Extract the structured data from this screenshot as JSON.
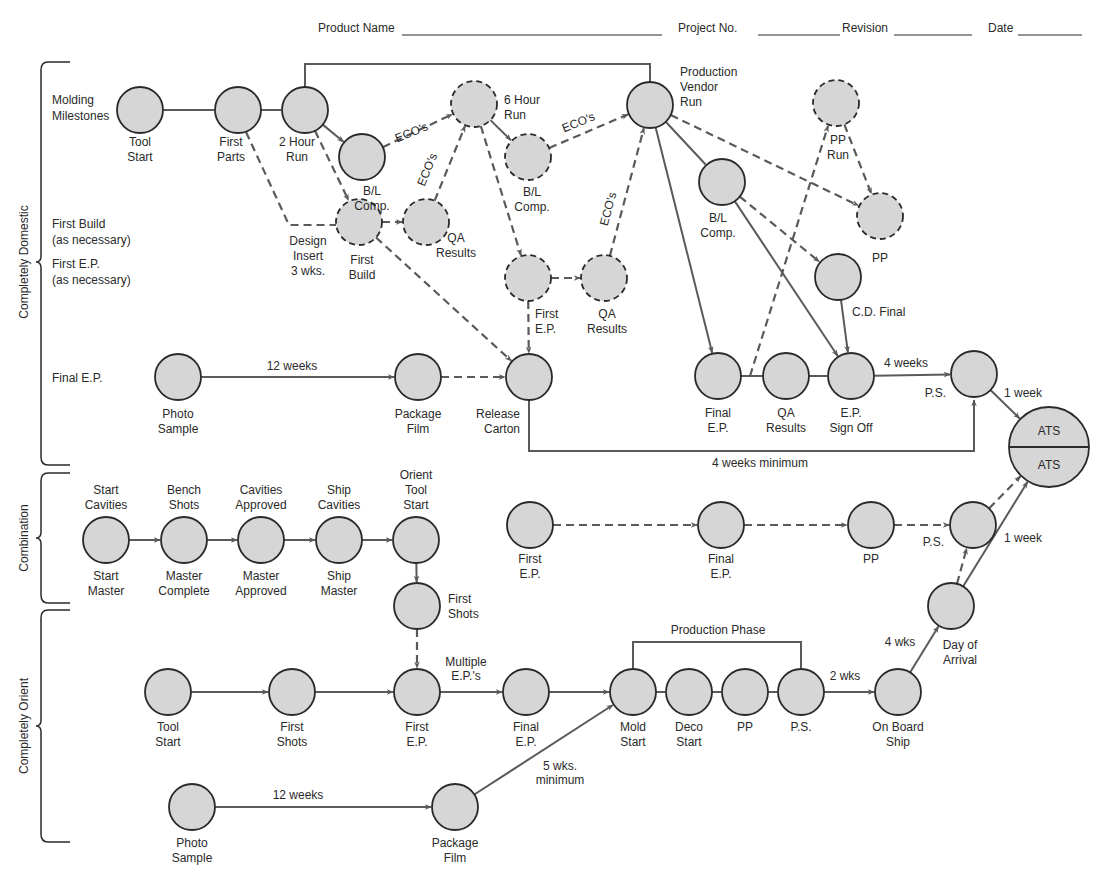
{
  "header": {
    "fields": [
      {
        "label": "Product Name",
        "x": 318,
        "line_x1": 402,
        "line_x2": 662
      },
      {
        "label": "Project No.",
        "x": 678,
        "line_x1": 758,
        "line_x2": 840
      },
      {
        "label": "Revision",
        "x": 842,
        "line_x1": 894,
        "line_x2": 972
      },
      {
        "label": "Date",
        "x": 988,
        "line_x1": 1018,
        "line_x2": 1082
      }
    ]
  },
  "groups": [
    {
      "label": "Completely Domestic",
      "y_top": 62,
      "y_bottom": 465,
      "label_y": 262
    },
    {
      "label": "Combination",
      "y_top": 473,
      "y_bottom": 603,
      "label_y": 538
    },
    {
      "label": "Completely Orient",
      "y_top": 610,
      "y_bottom": 842,
      "label_y": 726
    }
  ],
  "row_labels": [
    {
      "lines": [
        "Molding",
        "Milestones"
      ],
      "x": 52,
      "y": 104
    },
    {
      "lines": [
        "First Build",
        "(as necessary)"
      ],
      "x": 52,
      "y": 228
    },
    {
      "lines": [
        "First E.P.",
        "(as necessary)"
      ],
      "x": 52,
      "y": 268
    },
    {
      "lines": [
        "Final E.P."
      ],
      "x": 52,
      "y": 382
    }
  ],
  "nodes": [
    {
      "id": "d_tool_start",
      "x": 140,
      "y": 110,
      "r": 23,
      "dashed": false,
      "label": [
        "Tool",
        "Start"
      ],
      "lx": 140,
      "ly": 146,
      "anchor": "middle"
    },
    {
      "id": "d_first_parts",
      "x": 238,
      "y": 110,
      "r": 23,
      "dashed": false,
      "label": [
        "First",
        "Parts"
      ],
      "lx": 231,
      "ly": 146,
      "anchor": "middle"
    },
    {
      "id": "d_2hr_run",
      "x": 305,
      "y": 110,
      "r": 23,
      "dashed": false,
      "label": [
        "2 Hour",
        "Run"
      ],
      "lx": 297,
      "ly": 146,
      "anchor": "middle"
    },
    {
      "id": "d_bl_comp_1",
      "x": 362,
      "y": 157,
      "r": 23,
      "dashed": false,
      "label": [
        "B/L",
        "Comp."
      ],
      "lx": 372,
      "ly": 195,
      "anchor": "middle"
    },
    {
      "id": "d_6hr_run",
      "x": 474,
      "y": 104,
      "r": 23,
      "dashed": true,
      "label": [
        "6 Hour",
        "Run"
      ],
      "lx": 504,
      "ly": 104,
      "anchor": "start"
    },
    {
      "id": "d_bl_comp_2",
      "x": 528,
      "y": 157,
      "r": 23,
      "dashed": true,
      "label": [
        "B/L",
        "Comp."
      ],
      "lx": 532,
      "ly": 196,
      "anchor": "middle"
    },
    {
      "id": "d_first_build",
      "x": 359,
      "y": 222,
      "r": 23,
      "dashed": true,
      "label": [
        "First",
        "Build"
      ],
      "lx": 362,
      "ly": 264,
      "anchor": "middle"
    },
    {
      "id": "d_qa_results_1",
      "x": 426,
      "y": 222,
      "r": 23,
      "dashed": true,
      "label": [
        "QA",
        "Results"
      ],
      "lx": 456,
      "ly": 242,
      "anchor": "middle"
    },
    {
      "id": "d_first_ep",
      "x": 528,
      "y": 278,
      "r": 23,
      "dashed": true,
      "label": [
        "First",
        "E.P."
      ],
      "lx": 535,
      "ly": 318,
      "anchor": "start"
    },
    {
      "id": "d_qa_results_2",
      "x": 604,
      "y": 278,
      "r": 23,
      "dashed": true,
      "label": [
        "QA",
        "Results"
      ],
      "lx": 607,
      "ly": 318,
      "anchor": "middle"
    },
    {
      "id": "d_prod_vendor_run",
      "x": 650,
      "y": 105,
      "r": 23,
      "dashed": false,
      "label": [
        "Production",
        "Vendor",
        "Run"
      ],
      "lx": 680,
      "ly": 76,
      "anchor": "start"
    },
    {
      "id": "d_bl_comp_3",
      "x": 722,
      "y": 182,
      "r": 23,
      "dashed": false,
      "label": [
        "B/L",
        "Comp."
      ],
      "lx": 718,
      "ly": 222,
      "anchor": "middle"
    },
    {
      "id": "d_pp_run",
      "x": 836,
      "y": 103,
      "r": 23,
      "dashed": true,
      "label": [
        "PP",
        "Run"
      ],
      "lx": 838,
      "ly": 144,
      "anchor": "middle"
    },
    {
      "id": "d_pp",
      "x": 880,
      "y": 216,
      "r": 23,
      "dashed": true,
      "label": [
        "PP"
      ],
      "lx": 880,
      "ly": 262,
      "anchor": "middle"
    },
    {
      "id": "d_cd_final",
      "x": 838,
      "y": 277,
      "r": 23,
      "dashed": false,
      "label": [
        "C.D. Final"
      ],
      "lx": 852,
      "ly": 316,
      "anchor": "start"
    },
    {
      "id": "d_photo_sample",
      "x": 178,
      "y": 377,
      "r": 23,
      "dashed": false,
      "label": [
        "Photo",
        "Sample"
      ],
      "lx": 178,
      "ly": 418,
      "anchor": "middle"
    },
    {
      "id": "d_package_film",
      "x": 418,
      "y": 377,
      "r": 23,
      "dashed": false,
      "label": [
        "Package",
        "Film"
      ],
      "lx": 418,
      "ly": 418,
      "anchor": "middle"
    },
    {
      "id": "d_release_carton",
      "x": 529,
      "y": 377,
      "r": 23,
      "dashed": false,
      "label": [
        "Release",
        "Carton"
      ],
      "lx": 520,
      "ly": 418,
      "anchor": "end"
    },
    {
      "id": "d_final_ep",
      "x": 718,
      "y": 376,
      "r": 23,
      "dashed": false,
      "label": [
        "Final",
        "E.P."
      ],
      "lx": 718,
      "ly": 417,
      "anchor": "middle"
    },
    {
      "id": "d_qa_results_3",
      "x": 786,
      "y": 376,
      "r": 23,
      "dashed": false,
      "label": [
        "QA",
        "Results"
      ],
      "lx": 786,
      "ly": 417,
      "anchor": "middle"
    },
    {
      "id": "d_ep_sign_off",
      "x": 851,
      "y": 376,
      "r": 23,
      "dashed": false,
      "label": [
        "E.P.",
        "Sign Off"
      ],
      "lx": 851,
      "ly": 417,
      "anchor": "middle"
    },
    {
      "id": "d_ps",
      "x": 974,
      "y": 374,
      "r": 23,
      "dashed": false,
      "label": [
        "P.S."
      ],
      "lx": 946,
      "ly": 397,
      "anchor": "end"
    },
    {
      "id": "c_start",
      "x": 106,
      "y": 540,
      "r": 23,
      "dashed": false,
      "label_top": [
        "Start",
        "Cavities"
      ],
      "label": [
        "Start",
        "Master"
      ],
      "lx": 106,
      "ly": 580,
      "anchor": "middle"
    },
    {
      "id": "c_bench",
      "x": 184,
      "y": 540,
      "r": 23,
      "dashed": false,
      "label_top": [
        "Bench",
        "Shots"
      ],
      "label": [
        "Master",
        "Complete"
      ],
      "lx": 184,
      "ly": 580,
      "anchor": "middle"
    },
    {
      "id": "c_approved",
      "x": 261,
      "y": 540,
      "r": 23,
      "dashed": false,
      "label_top": [
        "Cavities",
        "Approved"
      ],
      "label": [
        "Master",
        "Approved"
      ],
      "lx": 261,
      "ly": 580,
      "anchor": "middle"
    },
    {
      "id": "c_ship",
      "x": 339,
      "y": 540,
      "r": 23,
      "dashed": false,
      "label_top": [
        "Ship",
        "Cavities"
      ],
      "label": [
        "Ship",
        "Master"
      ],
      "lx": 339,
      "ly": 580,
      "anchor": "middle"
    },
    {
      "id": "c_orient_tool",
      "x": 416,
      "y": 540,
      "r": 23,
      "dashed": false,
      "label_top": [
        "Orient",
        "Tool",
        "Start"
      ],
      "label": [],
      "lx": 416,
      "ly": 580,
      "anchor": "middle"
    },
    {
      "id": "c_first_shots",
      "x": 417,
      "y": 606,
      "r": 23,
      "dashed": false,
      "label": [
        "First",
        "Shots"
      ],
      "lx": 448,
      "ly": 603,
      "anchor": "start"
    },
    {
      "id": "c_first_ep",
      "x": 530,
      "y": 525,
      "r": 23,
      "dashed": false,
      "label": [
        "First",
        "E.P."
      ],
      "lx": 530,
      "ly": 563,
      "anchor": "middle"
    },
    {
      "id": "c_final_ep",
      "x": 721,
      "y": 525,
      "r": 23,
      "dashed": false,
      "label": [
        "Final",
        "E.P."
      ],
      "lx": 721,
      "ly": 563,
      "anchor": "middle"
    },
    {
      "id": "c_pp",
      "x": 871,
      "y": 525,
      "r": 23,
      "dashed": false,
      "label": [
        "PP"
      ],
      "lx": 871,
      "ly": 563,
      "anchor": "middle"
    },
    {
      "id": "c_ps",
      "x": 973,
      "y": 525,
      "r": 23,
      "dashed": false,
      "label": [
        "P.S."
      ],
      "lx": 944,
      "ly": 546,
      "anchor": "end"
    },
    {
      "id": "o_tool_start",
      "x": 168,
      "y": 692,
      "r": 23,
      "dashed": false,
      "label": [
        "Tool",
        "Start"
      ],
      "lx": 168,
      "ly": 731,
      "anchor": "middle"
    },
    {
      "id": "o_first_shots",
      "x": 292,
      "y": 692,
      "r": 23,
      "dashed": false,
      "label": [
        "First",
        "Shots"
      ],
      "lx": 292,
      "ly": 731,
      "anchor": "middle"
    },
    {
      "id": "o_first_ep",
      "x": 417,
      "y": 692,
      "r": 23,
      "dashed": false,
      "label": [
        "First",
        "E.P."
      ],
      "lx": 417,
      "ly": 731,
      "anchor": "middle"
    },
    {
      "id": "o_final_ep",
      "x": 526,
      "y": 692,
      "r": 23,
      "dashed": false,
      "label": [
        "Final",
        "E.P."
      ],
      "lx": 526,
      "ly": 731,
      "anchor": "middle"
    },
    {
      "id": "o_mold_start",
      "x": 633,
      "y": 692,
      "r": 23,
      "dashed": false,
      "label": [
        "Mold",
        "Start"
      ],
      "lx": 633,
      "ly": 731,
      "anchor": "middle"
    },
    {
      "id": "o_deco_start",
      "x": 689,
      "y": 692,
      "r": 23,
      "dashed": false,
      "label": [
        "Deco",
        "Start"
      ],
      "lx": 689,
      "ly": 731,
      "anchor": "middle"
    },
    {
      "id": "o_pp",
      "x": 745,
      "y": 692,
      "r": 23,
      "dashed": false,
      "label": [
        "PP"
      ],
      "lx": 745,
      "ly": 731,
      "anchor": "middle"
    },
    {
      "id": "o_ps",
      "x": 801,
      "y": 692,
      "r": 23,
      "dashed": false,
      "label": [
        "P.S."
      ],
      "lx": 801,
      "ly": 731,
      "anchor": "middle"
    },
    {
      "id": "o_on_board_ship",
      "x": 898,
      "y": 692,
      "r": 23,
      "dashed": false,
      "label": [
        "On Board",
        "Ship"
      ],
      "lx": 898,
      "ly": 731,
      "anchor": "middle"
    },
    {
      "id": "o_day_of_arrival",
      "x": 951,
      "y": 606,
      "r": 23,
      "dashed": false,
      "label": [
        "Day of",
        "Arrival"
      ],
      "lx": 960,
      "ly": 649,
      "anchor": "middle"
    },
    {
      "id": "o_photo_sample",
      "x": 192,
      "y": 807,
      "r": 23,
      "dashed": false,
      "label": [
        "Photo",
        "Sample"
      ],
      "lx": 192,
      "ly": 847,
      "anchor": "middle"
    },
    {
      "id": "o_package_film",
      "x": 455,
      "y": 807,
      "r": 23,
      "dashed": false,
      "label": [
        "Package",
        "Film"
      ],
      "lx": 455,
      "ly": 847,
      "anchor": "middle"
    }
  ],
  "ats_node": {
    "x": 1049,
    "y": 447,
    "r": 40,
    "top": "ATS",
    "bottom": "ATS"
  },
  "edges": [
    {
      "from": "d_tool_start",
      "to": "d_first_parts",
      "dashed": false,
      "arrow": false
    },
    {
      "from": "d_first_parts",
      "to": "d_2hr_run",
      "dashed": false,
      "arrow": false
    },
    {
      "from": "d_2hr_run",
      "to": "d_bl_comp_1",
      "dashed": false,
      "arrow": true
    },
    {
      "from": "d_2hr_run",
      "to": "d_first_build",
      "dashed": true,
      "arrow": true
    },
    {
      "from": "d_bl_comp_1",
      "to": "d_6hr_run",
      "dashed": true,
      "arrow": true
    },
    {
      "from": "d_qa_results_1",
      "to": "d_6hr_run",
      "dashed": true,
      "arrow": true
    },
    {
      "from": "d_first_build",
      "to": "d_qa_results_1",
      "dashed": true,
      "arrow": true
    },
    {
      "from": "d_6hr_run",
      "to": "d_bl_comp_2",
      "dashed": false,
      "arrow": true
    },
    {
      "from": "d_6hr_run",
      "to": "d_first_ep",
      "dashed": true,
      "arrow": true
    },
    {
      "from": "d_bl_comp_2",
      "to": "d_prod_vendor_run",
      "dashed": true,
      "arrow": true
    },
    {
      "from": "d_first_ep",
      "to": "d_qa_results_2",
      "dashed": true,
      "arrow": true
    },
    {
      "from": "d_qa_results_2",
      "to": "d_prod_vendor_run",
      "dashed": true,
      "arrow": true
    },
    {
      "from": "d_first_ep",
      "to": "d_release_carton",
      "dashed": true,
      "arrow": true
    },
    {
      "from": "d_first_build",
      "to": "d_release_carton",
      "dashed": true,
      "arrow": true
    },
    {
      "from": "d_prod_vendor_run",
      "to": "d_bl_comp_3",
      "dashed": false,
      "arrow": false
    },
    {
      "from": "d_prod_vendor_run",
      "to": "d_pp",
      "dashed": true,
      "arrow": true
    },
    {
      "from": "d_prod_vendor_run",
      "to": "d_final_ep",
      "dashed": false,
      "arrow": true
    },
    {
      "from": "d_bl_comp_3",
      "to": "d_cd_final",
      "dashed": true,
      "arrow": true
    },
    {
      "from": "d_bl_comp_3",
      "to": "d_ep_sign_off",
      "dashed": false,
      "arrow": true
    },
    {
      "from": "d_pp_run",
      "to": "d_pp",
      "dashed": true,
      "arrow": true
    },
    {
      "from": "d_cd_final",
      "to": "d_ep_sign_off",
      "dashed": false,
      "arrow": true
    },
    {
      "from": "d_final_ep",
      "to": "d_qa_results_3",
      "dashed": false,
      "arrow": false
    },
    {
      "from": "d_qa_results_3",
      "to": "d_ep_sign_off",
      "dashed": false,
      "arrow": false
    },
    {
      "from": "d_ep_sign_off",
      "to": "d_ps",
      "dashed": false,
      "arrow": true
    },
    {
      "from": "d_photo_sample",
      "to": "d_package_film",
      "dashed": false,
      "arrow": true
    },
    {
      "from": "d_package_film",
      "to": "d_release_carton",
      "dashed": true,
      "arrow": true
    },
    {
      "from": "d_ps",
      "to": "ats",
      "dashed": false,
      "arrow": true
    },
    {
      "from": "c_start",
      "to": "c_bench",
      "dashed": false,
      "arrow": true
    },
    {
      "from": "c_bench",
      "to": "c_approved",
      "dashed": false,
      "arrow": true
    },
    {
      "from": "c_approved",
      "to": "c_ship",
      "dashed": false,
      "arrow": true
    },
    {
      "from": "c_ship",
      "to": "c_orient_tool",
      "dashed": false,
      "arrow": true
    },
    {
      "from": "c_orient_tool",
      "to": "c_first_shots",
      "dashed": false,
      "arrow": true
    },
    {
      "from": "c_first_shots",
      "to": "o_first_ep",
      "dashed": true,
      "arrow": true
    },
    {
      "from": "c_first_ep",
      "to": "c_final_ep",
      "dashed": true,
      "arrow": true
    },
    {
      "from": "c_final_ep",
      "to": "c_pp",
      "dashed": true,
      "arrow": true
    },
    {
      "from": "c_pp",
      "to": "c_ps",
      "dashed": true,
      "arrow": true
    },
    {
      "from": "c_ps",
      "to": "ats",
      "dashed": true,
      "arrow": true
    },
    {
      "from": "o_tool_start",
      "to": "o_first_shots",
      "dashed": false,
      "arrow": true
    },
    {
      "from": "o_first_shots",
      "to": "o_first_ep",
      "dashed": false,
      "arrow": true
    },
    {
      "from": "o_first_ep",
      "to": "o_final_ep",
      "dashed": false,
      "arrow": true
    },
    {
      "from": "o_final_ep",
      "to": "o_mold_start",
      "dashed": false,
      "arrow": true
    },
    {
      "from": "o_mold_start",
      "to": "o_deco_start",
      "dashed": false,
      "arrow": false
    },
    {
      "from": "o_deco_start",
      "to": "o_pp",
      "dashed": false,
      "arrow": false
    },
    {
      "from": "o_pp",
      "to": "o_ps",
      "dashed": false,
      "arrow": false
    },
    {
      "from": "o_ps",
      "to": "o_on_board_ship",
      "dashed": false,
      "arrow": true
    },
    {
      "from": "o_on_board_ship",
      "to": "o_day_of_arrival",
      "dashed": false,
      "arrow": true
    },
    {
      "from": "o_day_of_arrival",
      "to": "c_ps",
      "dashed": true,
      "arrow": true
    },
    {
      "from": "o_day_of_arrival",
      "to": "ats",
      "dashed": false,
      "arrow": true
    },
    {
      "from": "o_photo_sample",
      "to": "o_package_film",
      "dashed": false,
      "arrow": true
    },
    {
      "from": "o_package_film",
      "to": "o_mold_start",
      "dashed": false,
      "arrow": true
    }
  ],
  "special_paths": [
    {
      "name": "molding-bracket-line",
      "d": "M305,87 L305,64 L650,64 L650,82",
      "dashed": false,
      "arrow": false
    },
    {
      "name": "first-parts-to-design-insert",
      "d": "M246,132 L289,225 L336,225",
      "dashed": true,
      "arrow": false
    },
    {
      "name": "release-carton-to-ps",
      "d": "M529,400 L529,451 L974,451 L974,400",
      "dashed": false,
      "arrow": true
    },
    {
      "name": "pp-run-from-final-ep-line",
      "d": "M750,376 L828,126",
      "dashed": true,
      "arrow": true
    },
    {
      "name": "production-phase-bracket",
      "d": "M633,669 L633,642 L801,642 L801,669",
      "dashed": false,
      "arrow": false
    }
  ],
  "edge_labels": [
    {
      "text": "ECO's",
      "x": 413,
      "y": 136,
      "rotate": -22
    },
    {
      "text": "ECO's",
      "x": 431,
      "y": 171,
      "rotate": -68
    },
    {
      "text": "ECO's",
      "x": 580,
      "y": 126,
      "rotate": -22
    },
    {
      "text": "ECO's",
      "x": 612,
      "y": 210,
      "rotate": -75
    },
    {
      "text": "Design",
      "x": 308,
      "y": 245,
      "rotate": 0
    },
    {
      "text": "Insert",
      "x": 308,
      "y": 260,
      "rotate": 0
    },
    {
      "text": "3 wks.",
      "x": 308,
      "y": 275,
      "rotate": 0
    },
    {
      "text": "12 weeks",
      "x": 292,
      "y": 370,
      "rotate": 0
    },
    {
      "text": "4 weeks",
      "x": 906,
      "y": 367,
      "rotate": 0
    },
    {
      "text": "1 week",
      "x": 1023,
      "y": 397,
      "rotate": 0
    },
    {
      "text": "4 weeks minimum",
      "x": 760,
      "y": 467,
      "rotate": 0
    },
    {
      "text": "1 week",
      "x": 1023,
      "y": 542,
      "rotate": 0
    },
    {
      "text": "Multiple",
      "x": 466,
      "y": 666,
      "rotate": 0
    },
    {
      "text": "E.P.'s",
      "x": 466,
      "y": 680,
      "rotate": 0
    },
    {
      "text": "Production Phase",
      "x": 718,
      "y": 634,
      "rotate": 0
    },
    {
      "text": "2 wks",
      "x": 845,
      "y": 680,
      "rotate": 0
    },
    {
      "text": "4 wks",
      "x": 900,
      "y": 646,
      "rotate": 0
    },
    {
      "text": "5 wks.",
      "x": 560,
      "y": 770,
      "rotate": 0
    },
    {
      "text": "minimum",
      "x": 560,
      "y": 784,
      "rotate": 0
    },
    {
      "text": "12 weeks",
      "x": 298,
      "y": 799,
      "rotate": 0
    }
  ]
}
